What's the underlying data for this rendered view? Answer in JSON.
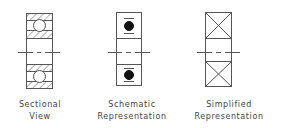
{
  "figure": {
    "views": [
      {
        "id": "sectional",
        "line1": "Sectional",
        "line2": "View"
      },
      {
        "id": "schematic",
        "line1": "Schematic",
        "line2": "Representation"
      },
      {
        "id": "simplified",
        "line1": "Simplified",
        "line2": "Representation"
      }
    ]
  },
  "colors": {
    "line": "#555555",
    "fill": "#111111",
    "background": "#ffffff"
  }
}
